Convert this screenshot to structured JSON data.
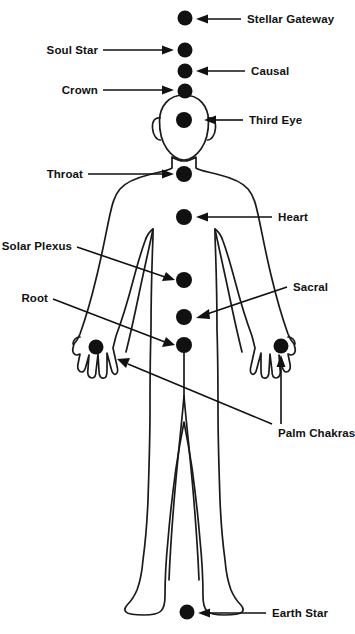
{
  "diagram": {
    "figure_name": "human-body-outline",
    "stroke_color": "#1a1a1a",
    "dot_color": "#111111",
    "background_color": "#ffffff",
    "labels": {
      "stellar_gateway": "Stellar Gateway",
      "soul_star": "Soul Star",
      "causal": "Causal",
      "crown": "Crown",
      "third_eye": "Third Eye",
      "throat": "Throat",
      "heart": "Heart",
      "solar_plexus": "Solar Plexus",
      "sacral": "Sacral",
      "root": "Root",
      "palm_chakras": "Palm Chakras",
      "earth_star": "Earth Star"
    },
    "chakras": [
      {
        "key": "stellar_gateway",
        "label": "Stellar Gateway",
        "x": 185,
        "y": 18,
        "r": 7.5,
        "label_side": "right"
      },
      {
        "key": "soul_star",
        "label": "Soul Star",
        "x": 185,
        "y": 50,
        "r": 7.5,
        "label_side": "left"
      },
      {
        "key": "causal",
        "label": "Causal",
        "x": 185,
        "y": 71,
        "r": 7.5,
        "label_side": "right"
      },
      {
        "key": "crown",
        "label": "Crown",
        "x": 185,
        "y": 91,
        "r": 7.5,
        "label_side": "left"
      },
      {
        "key": "third_eye",
        "label": "Third Eye",
        "x": 184,
        "y": 120,
        "r": 8.0,
        "label_side": "right"
      },
      {
        "key": "throat",
        "label": "Throat",
        "x": 184,
        "y": 174,
        "r": 8.0,
        "label_side": "left"
      },
      {
        "key": "heart",
        "label": "Heart",
        "x": 184,
        "y": 217,
        "r": 8.0,
        "label_side": "right"
      },
      {
        "key": "solar_plexus",
        "label": "Solar Plexus",
        "x": 184,
        "y": 280,
        "r": 8.0,
        "label_side": "left"
      },
      {
        "key": "sacral",
        "label": "Sacral",
        "x": 184,
        "y": 317,
        "r": 8.0,
        "label_side": "right"
      },
      {
        "key": "root",
        "label": "Root",
        "x": 184,
        "y": 345,
        "r": 8.0,
        "label_side": "left"
      },
      {
        "key": "palm_left",
        "label": "Palm Chakras",
        "x": 96,
        "y": 347,
        "r": 7.5,
        "label_side": "right"
      },
      {
        "key": "palm_right",
        "label": "Palm Chakras",
        "x": 281,
        "y": 346,
        "r": 7.5,
        "label_side": "right"
      },
      {
        "key": "earth_star",
        "label": "Earth Star",
        "x": 187,
        "y": 612,
        "r": 7.5,
        "label_side": "right"
      }
    ]
  }
}
